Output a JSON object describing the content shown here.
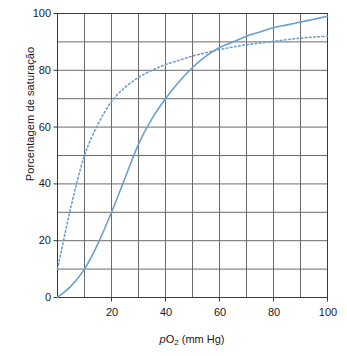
{
  "chart_data": {
    "type": "line",
    "title": "",
    "xlabel": "pO2 (mm Hg)",
    "xlabel_parts": {
      "italic_p": "p",
      "o": "O",
      "sub": "2",
      "rest": " (mm Hg)"
    },
    "ylabel": "Porcentagem de saturação",
    "xlim": [
      0,
      100
    ],
    "ylim": [
      0,
      100
    ],
    "xticks": [
      20,
      40,
      60,
      80,
      100
    ],
    "xtick_labels": [
      "20",
      "40",
      "60",
      "80",
      "100"
    ],
    "yticks": [
      0,
      20,
      40,
      60,
      80,
      100
    ],
    "ytick_labels": [
      "0",
      "20",
      "40",
      "60",
      "80",
      "100"
    ],
    "grid": true,
    "grid_x_step": 10,
    "grid_y_step": 10,
    "grid_color": "#6b6b6b",
    "axis_color": "#3a3a3a",
    "legend": "none",
    "series": [
      {
        "name": "curva sigmoide (linha cheia)",
        "style": "solid",
        "color": "#6a9fd0",
        "x": [
          0,
          5,
          10,
          15,
          20,
          25,
          30,
          35,
          40,
          45,
          50,
          55,
          60,
          65,
          70,
          75,
          80,
          85,
          90,
          95,
          100
        ],
        "values": [
          0,
          4,
          10,
          19,
          30,
          42,
          54,
          63,
          70,
          76,
          81,
          85,
          88,
          90,
          92,
          93.5,
          95,
          96,
          97,
          98,
          99
        ]
      },
      {
        "name": "curva hiperbólica (linha pontilhada)",
        "style": "dotted",
        "color": "#6a9fd0",
        "x": [
          0,
          5,
          10,
          15,
          20,
          25,
          30,
          35,
          40,
          45,
          50,
          55,
          60,
          65,
          70,
          75,
          80,
          85,
          90,
          95,
          100
        ],
        "values": [
          10,
          32,
          50,
          61,
          69,
          74,
          77.5,
          80,
          82,
          83.5,
          85,
          86.2,
          87.3,
          88.2,
          89,
          89.6,
          90.2,
          90.8,
          91.3,
          91.7,
          92
        ]
      }
    ]
  }
}
